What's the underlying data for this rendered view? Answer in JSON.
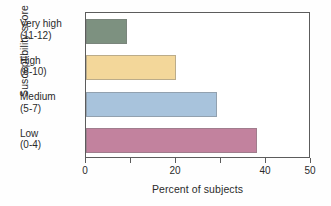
{
  "chart_data": {
    "type": "bar",
    "orientation": "horizontal",
    "title": "",
    "xlabel": "Percent of subjects",
    "ylabel": "Susceptibility score",
    "categories": [
      {
        "name": "Low",
        "range": "(0-4)",
        "label_line1": "Low",
        "label_line2": "(0-4)"
      },
      {
        "name": "Medium",
        "range": "(5-7)",
        "label_line1": "Medium",
        "label_line2": "(5-7)"
      },
      {
        "name": "High",
        "range": "(8-10)",
        "label_line1": "High",
        "label_line2": "(8-10)"
      },
      {
        "name": "Very high",
        "range": "(11-12)",
        "label_line1": "Very high",
        "label_line2": "(11-12)"
      }
    ],
    "values": [
      38,
      29,
      20,
      9
    ],
    "bar_colors": [
      "#c2829e",
      "#a8c3dc",
      "#f3d79a",
      "#7d9180"
    ],
    "xlim": [
      0,
      50
    ],
    "xticks": [
      0,
      10,
      20,
      30,
      40,
      50
    ],
    "xtick_labels": [
      "0",
      "",
      "20",
      "",
      "40",
      "50"
    ],
    "grid": false,
    "legend": "none"
  },
  "axes": {
    "x_title": "Percent of subjects",
    "y_title": "Susceptibility score"
  }
}
